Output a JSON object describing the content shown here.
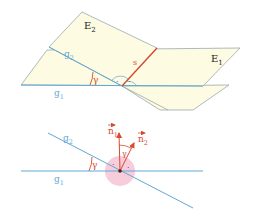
{
  "colors": {
    "plane_fill": "#fdfbe2",
    "plane_stroke": "#9aa8ae",
    "line_blue": "#5fa8d6",
    "intersection_red": "#d94a2e",
    "angle_fill": "#f4b8cc",
    "label_dark": "#222222",
    "label_blue": "#5fa8d6",
    "label_red": "#d94a2e"
  },
  "top_figure": {
    "plane_e2_label": "E",
    "plane_e2_sub": "2",
    "plane_e1_label": "E",
    "plane_e1_sub": "1",
    "line_g2_label": "g",
    "line_g2_sub": "2",
    "line_g1_label": "g",
    "line_g1_sub": "1",
    "intersection_label": "s",
    "angle_label": "γ",
    "right_angle_marks": [
      "·",
      "·"
    ]
  },
  "bottom_figure": {
    "line_g2_label": "g",
    "line_g2_sub": "2",
    "line_g1_label": "g",
    "line_g1_sub": "1",
    "angle_label_lines": "γ",
    "angle_label_normals": "γ",
    "normal_1_label": "n",
    "normal_1_sub": "1",
    "normal_2_label": "n",
    "normal_2_sub": "2",
    "right_angle_marks": [
      "·",
      "·"
    ]
  }
}
